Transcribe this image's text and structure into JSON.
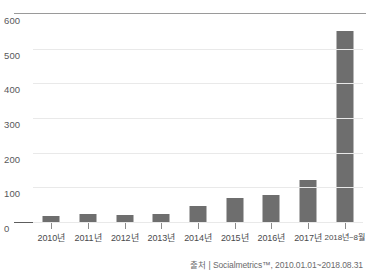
{
  "chart_data": {
    "type": "bar",
    "title": "",
    "xlabel": "",
    "ylabel": "",
    "categories": [
      "2010년",
      "2011년",
      "2012년",
      "2013년",
      "2014년",
      "2015년",
      "2016년",
      "2017년",
      "2018년~8월"
    ],
    "values": [
      16,
      24,
      20,
      22,
      45,
      68,
      78,
      120,
      552
    ],
    "ylim": [
      0,
      600
    ],
    "yticks": [
      0,
      100,
      200,
      300,
      400,
      500,
      600
    ],
    "ytick_labels": [
      "0",
      "100",
      "200",
      "300",
      "400",
      "500",
      "600"
    ],
    "grid": true,
    "legend": false,
    "series": [
      {
        "name": "",
        "values": [
          16,
          24,
          20,
          22,
          45,
          68,
          78,
          120,
          552
        ]
      }
    ],
    "colors": {
      "bar": "#6e6e6e",
      "grid": "#e9e9e9",
      "axis": "#5d5d5d",
      "top_frame": "#9a9a9a",
      "tick_text": "#58585a",
      "source_text": "#6a6a6c"
    }
  },
  "footer": {
    "source_text": "출처 | Socialmetrics™, 2010.01.01~2018.08.31"
  }
}
